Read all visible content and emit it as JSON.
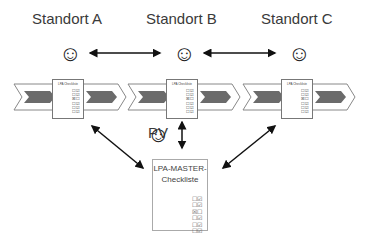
{
  "sites": [
    {
      "label": "Standort A",
      "checklist_title": "LPA Checkliste"
    },
    {
      "label": "Standort B",
      "checklist_title": "LPA Checkliste"
    },
    {
      "label": "Standort C",
      "checklist_title": "LPA Checkliste"
    }
  ],
  "smiley": "☺",
  "checkbox_rows": [
    "☐☑",
    "☐☑",
    "☒☐",
    "☐☑",
    "☐☑",
    "☐☑"
  ],
  "pv": {
    "label": "PV"
  },
  "master": {
    "title_line1": "LPA-MASTER-",
    "title_line2": "Checkliste"
  },
  "colors": {
    "chevron_fill": "#6b6b6b",
    "chevron_outline": "#888888",
    "arrow": "#111111"
  }
}
